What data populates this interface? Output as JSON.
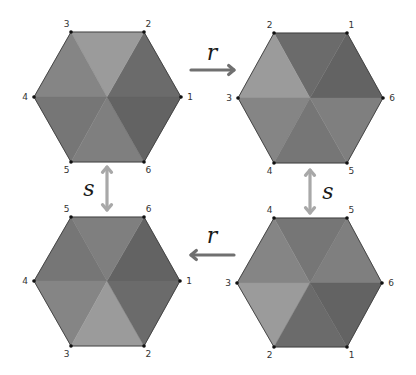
{
  "diagram": {
    "triangle_colors": {
      "1-2": "#6b6b6b",
      "2-3": "#9b9b9b",
      "3-4": "#858585",
      "4-5": "#767676",
      "5-6": "#7f7f7f",
      "6-1": "#636363"
    },
    "hexagons": [
      {
        "id": "top-left",
        "center": [
          107,
          97
        ],
        "vertices": [
          {
            "label": "1",
            "pos": [
              181,
              97
            ]
          },
          {
            "label": "2",
            "pos": [
              144,
              32
            ]
          },
          {
            "label": "3",
            "pos": [
              71,
              32
            ]
          },
          {
            "label": "4",
            "pos": [
              34,
              97
            ]
          },
          {
            "label": "5",
            "pos": [
              71,
              162
            ]
          },
          {
            "label": "6",
            "pos": [
              144,
              162
            ]
          }
        ]
      },
      {
        "id": "top-right",
        "center": [
          310,
          98
        ],
        "vertices": [
          {
            "label": "6",
            "pos": [
              383,
              98
            ]
          },
          {
            "label": "1",
            "pos": [
              347,
              33
            ]
          },
          {
            "label": "2",
            "pos": [
              274,
              33
            ]
          },
          {
            "label": "3",
            "pos": [
              238,
              98
            ]
          },
          {
            "label": "4",
            "pos": [
              274,
              163
            ]
          },
          {
            "label": "5",
            "pos": [
              347,
              163
            ]
          }
        ]
      },
      {
        "id": "bottom-left",
        "center": [
          107,
          281
        ],
        "vertices": [
          {
            "label": "1",
            "pos": [
              180,
              281
            ]
          },
          {
            "label": "6",
            "pos": [
              144,
              217
            ]
          },
          {
            "label": "5",
            "pos": [
              71,
              217
            ]
          },
          {
            "label": "4",
            "pos": [
              34,
              281
            ]
          },
          {
            "label": "3",
            "pos": [
              71,
              346
            ]
          },
          {
            "label": "2",
            "pos": [
              144,
              346
            ]
          }
        ]
      },
      {
        "id": "bottom-right",
        "center": [
          310,
          283
        ],
        "vertices": [
          {
            "label": "6",
            "pos": [
              382,
              283
            ]
          },
          {
            "label": "5",
            "pos": [
              347,
              218
            ]
          },
          {
            "label": "4",
            "pos": [
              274,
              218
            ]
          },
          {
            "label": "3",
            "pos": [
              237,
              283
            ]
          },
          {
            "label": "2",
            "pos": [
              274,
              347
            ]
          },
          {
            "label": "1",
            "pos": [
              347,
              347
            ]
          }
        ]
      }
    ],
    "arrows": [
      {
        "id": "r-top",
        "label": "r",
        "from": [
          191,
          70
        ],
        "to": [
          234,
          70
        ],
        "double": false,
        "color": "#707070",
        "label_pos": [
          212,
          60
        ]
      },
      {
        "id": "r-bottom",
        "label": "r",
        "from": [
          234,
          255
        ],
        "to": [
          191,
          255
        ],
        "double": false,
        "color": "#707070",
        "label_pos": [
          212,
          243
        ]
      },
      {
        "id": "s-left",
        "label": "s",
        "from": [
          107,
          167
        ],
        "to": [
          107,
          210
        ],
        "double": true,
        "color": "#a8a8a8",
        "label_pos": [
          89,
          196
        ]
      },
      {
        "id": "s-right",
        "label": "s",
        "from": [
          310,
          170
        ],
        "to": [
          310,
          213
        ],
        "double": true,
        "color": "#a8a8a8",
        "label_pos": [
          328,
          199
        ]
      }
    ],
    "vertex_dot_color": "#111111"
  }
}
